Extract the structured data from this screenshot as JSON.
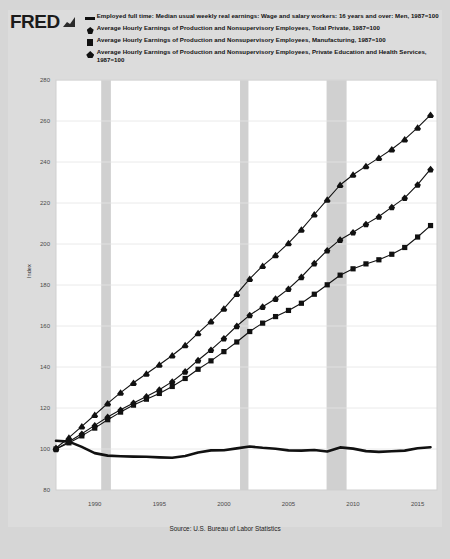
{
  "brand": {
    "name": "FRED",
    "logo_icon": "fred-chart-icon"
  },
  "legend": [
    {
      "marker": "line",
      "marker_icon": "legend-line-icon",
      "label": "Employed full time: Median usual weekly real earnings: Wage and salary workers: 16 years and over: Men, 1987=100"
    },
    {
      "marker": "diamond",
      "marker_icon": "legend-diamond-icon",
      "label": "Average Hourly Earnings of Production and Nonsupervisory Employees, Total Private, 1987=100"
    },
    {
      "marker": "square",
      "marker_icon": "legend-square-icon",
      "label": "Average Hourly Earnings of Production and Nonsupervisory Employees, Manufacturing, 1987=100"
    },
    {
      "marker": "triangle",
      "marker_icon": "legend-triangle-icon",
      "label": "Average Hourly Earnings of Production and Nonsupervisory Employees, Private Education and Health Services, 1987=100"
    }
  ],
  "source": "Source: U.S. Bureau of Labor Statistics",
  "colors": {
    "background": "#d6d6d6",
    "panel": "#dcdcdc",
    "plot": "#ffffff",
    "series": "#111111",
    "recession": "#d0d0d0",
    "grid": "#e4e4e4"
  },
  "chart_data": {
    "type": "line",
    "title": "",
    "xlabel": "",
    "ylabel": "Index",
    "ylim": [
      80,
      280
    ],
    "yticks": [
      80,
      100,
      120,
      140,
      160,
      180,
      200,
      220,
      240,
      260,
      280
    ],
    "xlim": [
      1987,
      2016.5
    ],
    "xticks": [
      1990,
      1995,
      2000,
      2005,
      2010,
      2015
    ],
    "grid": true,
    "legend_position": "top",
    "recessions": [
      {
        "start": 1990.5,
        "end": 1991.25
      },
      {
        "start": 2001.25,
        "end": 2001.9
      },
      {
        "start": 2007.95,
        "end": 2009.5
      }
    ],
    "x": [
      1987,
      1988,
      1989,
      1990,
      1991,
      1992,
      1993,
      1994,
      1995,
      1996,
      1997,
      1998,
      1999,
      2000,
      2001,
      2002,
      2003,
      2004,
      2005,
      2006,
      2007,
      2008,
      2009,
      2010,
      2011,
      2012,
      2013,
      2014,
      2015,
      2016
    ],
    "series": [
      {
        "name": "Employed full time: Median usual weekly real earnings: Wage and salary workers: 16 years and over: Men, 1987=100",
        "marker": "line",
        "values": [
          104.0,
          103.6,
          101.0,
          98.0,
          96.8,
          96.5,
          96.3,
          96.2,
          95.9,
          95.7,
          96.6,
          98.3,
          99.3,
          99.4,
          100.3,
          101.2,
          100.6,
          100.1,
          99.3,
          99.2,
          99.5,
          98.8,
          100.8,
          100.2,
          99.0,
          98.6,
          98.9,
          99.2,
          100.4,
          100.9
        ]
      },
      {
        "name": "Average Hourly Earnings of Production and Nonsupervisory Employees, Total Private, 1987=100",
        "marker": "diamond",
        "values": [
          100.0,
          103.5,
          107.4,
          111.5,
          115.6,
          119.1,
          122.5,
          125.6,
          128.9,
          132.9,
          137.8,
          143.3,
          148.4,
          154.0,
          160.0,
          165.3,
          169.4,
          173.3,
          178.1,
          183.9,
          190.6,
          196.9,
          202.1,
          205.7,
          209.7,
          213.4,
          218.0,
          222.5,
          229.0,
          236.5
        ]
      },
      {
        "name": "Average Hourly Earnings of Production and Nonsupervisory Employees, Manufacturing, 1987=100",
        "marker": "square",
        "values": [
          100.0,
          103.0,
          106.4,
          110.2,
          114.3,
          118.0,
          121.4,
          124.3,
          127.1,
          130.5,
          134.4,
          138.9,
          143.0,
          147.5,
          152.2,
          157.3,
          161.4,
          164.6,
          167.6,
          171.1,
          175.5,
          180.1,
          184.8,
          187.9,
          190.3,
          192.3,
          195.0,
          198.3,
          203.4,
          209.0
        ]
      },
      {
        "name": "Average Hourly Earnings of Production and Nonsupervisory Employees, Private Education and Health Services, 1987=100",
        "marker": "triangle",
        "values": [
          100.5,
          105.5,
          111.0,
          116.6,
          122.3,
          127.5,
          132.3,
          136.7,
          141.1,
          145.6,
          150.6,
          156.5,
          162.3,
          168.5,
          175.7,
          183.0,
          189.3,
          194.6,
          200.4,
          207.0,
          214.4,
          221.6,
          228.8,
          233.8,
          238.0,
          242.0,
          246.2,
          251.0,
          256.8,
          263.0
        ]
      }
    ]
  }
}
